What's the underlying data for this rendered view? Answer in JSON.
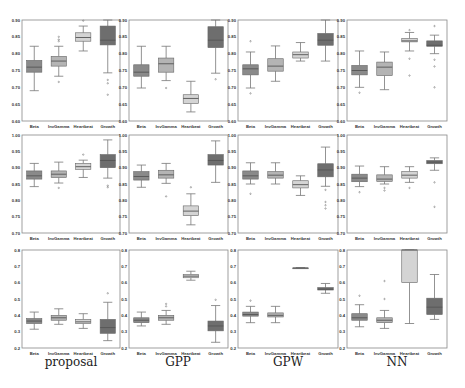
{
  "colors": {
    "Beta": "#8a8a8a",
    "InvGamma": "#b4b4b4",
    "Heartbeat": "#d4d4d4",
    "Growth": "#6e6e6e",
    "median": "#555555",
    "whisker": "#777777",
    "frame": "#888888"
  },
  "column_labels": [
    "proposal",
    "GPP",
    "GPW",
    "NN"
  ],
  "chart_data": [
    {
      "type": "box",
      "row": 0,
      "col": 0,
      "method": "proposal",
      "categories": [
        "Beta",
        "InvGamma",
        "Heartbeat",
        "Growth"
      ],
      "ylim": [
        0.6,
        0.9
      ],
      "yticks": [
        0.6,
        0.65,
        0.7,
        0.75,
        0.8,
        0.85,
        0.9
      ],
      "boxes": [
        {
          "wlo": 0.69,
          "q1": 0.745,
          "med": 0.76,
          "q3": 0.78,
          "whi": 0.822,
          "fliers": []
        },
        {
          "wlo": 0.733,
          "q1": 0.763,
          "med": 0.778,
          "q3": 0.792,
          "whi": 0.822,
          "fliers": [
            0.716,
            0.837,
            0.842,
            0.85
          ]
        },
        {
          "wlo": 0.808,
          "q1": 0.837,
          "med": 0.848,
          "q3": 0.862,
          "whi": 0.882,
          "fliers": [
            0.898
          ]
        },
        {
          "wlo": 0.743,
          "q1": 0.826,
          "med": 0.84,
          "q3": 0.882,
          "whi": 0.9,
          "fliers": [
            0.722,
            0.712,
            0.678
          ]
        }
      ]
    },
    {
      "type": "box",
      "row": 0,
      "col": 1,
      "method": "GPP",
      "categories": [
        "Beta",
        "InvGamma",
        "Heartbeat",
        "Growth"
      ],
      "ylim": [
        0.6,
        0.9
      ],
      "yticks": [
        0.6,
        0.65,
        0.7,
        0.75,
        0.8,
        0.85,
        0.9
      ],
      "boxes": [
        {
          "wlo": 0.698,
          "q1": 0.733,
          "med": 0.745,
          "q3": 0.767,
          "whi": 0.822,
          "fliers": []
        },
        {
          "wlo": 0.72,
          "q1": 0.745,
          "med": 0.77,
          "q3": 0.787,
          "whi": 0.822,
          "fliers": [
            0.698
          ]
        },
        {
          "wlo": 0.627,
          "q1": 0.652,
          "med": 0.667,
          "q3": 0.678,
          "whi": 0.718,
          "fliers": []
        },
        {
          "wlo": 0.742,
          "q1": 0.818,
          "med": 0.84,
          "q3": 0.88,
          "whi": 0.9,
          "fliers": [
            0.724
          ]
        }
      ]
    },
    {
      "type": "box",
      "row": 0,
      "col": 2,
      "method": "GPW",
      "categories": [
        "Beta",
        "InvGamma",
        "Heartbeat",
        "Growth"
      ],
      "ylim": [
        0.6,
        0.9
      ],
      "yticks": [
        0.6,
        0.65,
        0.7,
        0.75,
        0.8,
        0.85,
        0.9
      ],
      "boxes": [
        {
          "wlo": 0.698,
          "q1": 0.737,
          "med": 0.755,
          "q3": 0.767,
          "whi": 0.805,
          "fliers": [
            0.837,
            0.682
          ]
        },
        {
          "wlo": 0.718,
          "q1": 0.748,
          "med": 0.763,
          "q3": 0.785,
          "whi": 0.823,
          "fliers": []
        },
        {
          "wlo": 0.778,
          "q1": 0.787,
          "med": 0.797,
          "q3": 0.805,
          "whi": 0.833,
          "fliers": []
        },
        {
          "wlo": 0.778,
          "q1": 0.825,
          "med": 0.84,
          "q3": 0.86,
          "whi": 0.9,
          "fliers": []
        }
      ]
    },
    {
      "type": "box",
      "row": 0,
      "col": 3,
      "method": "NN",
      "categories": [
        "Beta",
        "InvGamma",
        "Heartbeat",
        "Growth"
      ],
      "ylim": [
        0.6,
        0.9
      ],
      "yticks": [
        0.6,
        0.65,
        0.7,
        0.75,
        0.8,
        0.85,
        0.9
      ],
      "boxes": [
        {
          "wlo": 0.7,
          "q1": 0.737,
          "med": 0.75,
          "q3": 0.765,
          "whi": 0.808,
          "fliers": [
            0.684
          ]
        },
        {
          "wlo": 0.693,
          "q1": 0.735,
          "med": 0.76,
          "q3": 0.775,
          "whi": 0.805,
          "fliers": []
        },
        {
          "wlo": 0.808,
          "q1": 0.835,
          "med": 0.838,
          "q3": 0.845,
          "whi": 0.863,
          "fliers": [
            0.87,
            0.785,
            0.735
          ]
        },
        {
          "wlo": 0.8,
          "q1": 0.822,
          "med": 0.825,
          "q3": 0.838,
          "whi": 0.855,
          "fliers": [
            0.882,
            0.782,
            0.762,
            0.7
          ]
        }
      ]
    },
    {
      "type": "box",
      "row": 1,
      "col": 0,
      "method": "proposal",
      "categories": [
        "Beta",
        "InvGamma",
        "Heartbeat",
        "Growth"
      ],
      "ylim": [
        0.7,
        1.0
      ],
      "yticks": [
        0.7,
        0.75,
        0.8,
        0.85,
        0.9,
        0.95,
        1.0
      ],
      "boxes": [
        {
          "wlo": 0.842,
          "q1": 0.865,
          "med": 0.875,
          "q3": 0.89,
          "whi": 0.913,
          "fliers": []
        },
        {
          "wlo": 0.853,
          "q1": 0.87,
          "med": 0.88,
          "q3": 0.89,
          "whi": 0.917,
          "fliers": [
            0.838
          ]
        },
        {
          "wlo": 0.87,
          "q1": 0.895,
          "med": 0.903,
          "q3": 0.913,
          "whi": 0.923,
          "fliers": [
            0.94
          ]
        },
        {
          "wlo": 0.868,
          "q1": 0.9,
          "med": 0.922,
          "q3": 0.94,
          "whi": 0.985,
          "fliers": [
            0.845,
            0.84
          ]
        }
      ]
    },
    {
      "type": "box",
      "row": 1,
      "col": 1,
      "method": "GPP",
      "categories": [
        "Beta",
        "InvGamma",
        "Heartbeat",
        "Growth"
      ],
      "ylim": [
        0.7,
        1.0
      ],
      "yticks": [
        0.7,
        0.75,
        0.8,
        0.85,
        0.9,
        0.95,
        1.0
      ],
      "boxes": [
        {
          "wlo": 0.84,
          "q1": 0.862,
          "med": 0.873,
          "q3": 0.888,
          "whi": 0.908,
          "fliers": []
        },
        {
          "wlo": 0.852,
          "q1": 0.868,
          "med": 0.878,
          "q3": 0.892,
          "whi": 0.913,
          "fliers": [
            0.812
          ]
        },
        {
          "wlo": 0.725,
          "q1": 0.753,
          "med": 0.767,
          "q3": 0.783,
          "whi": 0.82,
          "fliers": [
            0.84
          ]
        },
        {
          "wlo": 0.855,
          "q1": 0.908,
          "med": 0.922,
          "q3": 0.94,
          "whi": 0.982,
          "fliers": []
        }
      ]
    },
    {
      "type": "box",
      "row": 1,
      "col": 2,
      "method": "GPW",
      "categories": [
        "Beta",
        "InvGamma",
        "Heartbeat",
        "Growth"
      ],
      "ylim": [
        0.7,
        1.0
      ],
      "yticks": [
        0.7,
        0.75,
        0.8,
        0.85,
        0.9,
        0.95,
        1.0
      ],
      "boxes": [
        {
          "wlo": 0.85,
          "q1": 0.865,
          "med": 0.875,
          "q3": 0.89,
          "whi": 0.915,
          "fliers": [
            0.82
          ]
        },
        {
          "wlo": 0.85,
          "q1": 0.868,
          "med": 0.877,
          "q3": 0.888,
          "whi": 0.915,
          "fliers": []
        },
        {
          "wlo": 0.815,
          "q1": 0.838,
          "med": 0.848,
          "q3": 0.86,
          "whi": 0.875,
          "fliers": []
        },
        {
          "wlo": 0.843,
          "q1": 0.872,
          "med": 0.893,
          "q3": 0.912,
          "whi": 0.963,
          "fliers": [
            0.832,
            0.795,
            0.785,
            0.775
          ]
        }
      ]
    },
    {
      "type": "box",
      "row": 1,
      "col": 3,
      "method": "NN",
      "categories": [
        "Beta",
        "InvGamma",
        "Heartbeat",
        "Growth"
      ],
      "ylim": [
        0.7,
        1.0
      ],
      "yticks": [
        0.7,
        0.75,
        0.8,
        0.85,
        0.9,
        0.95,
        1.0
      ],
      "boxes": [
        {
          "wlo": 0.842,
          "q1": 0.857,
          "med": 0.868,
          "q3": 0.88,
          "whi": 0.905,
          "fliers": [
            0.825
          ]
        },
        {
          "wlo": 0.85,
          "q1": 0.858,
          "med": 0.865,
          "q3": 0.878,
          "whi": 0.903,
          "fliers": [
            0.83,
            0.838
          ]
        },
        {
          "wlo": 0.855,
          "q1": 0.868,
          "med": 0.877,
          "q3": 0.888,
          "whi": 0.903,
          "fliers": [
            0.838
          ]
        },
        {
          "wlo": 0.892,
          "q1": 0.912,
          "med": 0.917,
          "q3": 0.922,
          "whi": 0.93,
          "fliers": [
            0.855,
            0.78
          ]
        }
      ]
    },
    {
      "type": "box",
      "row": 2,
      "col": 0,
      "method": "proposal",
      "categories": [
        "Beta",
        "InvGamma",
        "Heartbeat",
        "Growth"
      ],
      "ylim": [
        0.2,
        0.8
      ],
      "yticks": [
        0.2,
        0.3,
        0.4,
        0.5,
        0.6,
        0.7,
        0.8
      ],
      "boxes": [
        {
          "wlo": 0.315,
          "q1": 0.35,
          "med": 0.365,
          "q3": 0.38,
          "whi": 0.42,
          "fliers": []
        },
        {
          "wlo": 0.345,
          "q1": 0.37,
          "med": 0.385,
          "q3": 0.4,
          "whi": 0.44,
          "fliers": []
        },
        {
          "wlo": 0.32,
          "q1": 0.35,
          "med": 0.36,
          "q3": 0.375,
          "whi": 0.41,
          "fliers": []
        },
        {
          "wlo": 0.245,
          "q1": 0.29,
          "med": 0.325,
          "q3": 0.375,
          "whi": 0.48,
          "fliers": [
            0.535
          ]
        }
      ]
    },
    {
      "type": "box",
      "row": 2,
      "col": 1,
      "method": "GPP",
      "categories": [
        "Beta",
        "InvGamma",
        "Heartbeat",
        "Growth"
      ],
      "ylim": [
        0.2,
        0.8
      ],
      "yticks": [
        0.2,
        0.3,
        0.4,
        0.5,
        0.6,
        0.7,
        0.8
      ],
      "boxes": [
        {
          "wlo": 0.335,
          "q1": 0.355,
          "med": 0.37,
          "q3": 0.385,
          "whi": 0.42,
          "fliers": []
        },
        {
          "wlo": 0.345,
          "q1": 0.37,
          "med": 0.385,
          "q3": 0.4,
          "whi": 0.43,
          "fliers": [
            0.455,
            0.47
          ]
        },
        {
          "wlo": 0.615,
          "q1": 0.63,
          "med": 0.64,
          "q3": 0.65,
          "whi": 0.67,
          "fliers": []
        },
        {
          "wlo": 0.235,
          "q1": 0.305,
          "med": 0.335,
          "q3": 0.365,
          "whi": 0.46,
          "fliers": [
            0.495
          ]
        }
      ]
    },
    {
      "type": "box",
      "row": 2,
      "col": 2,
      "method": "GPW",
      "categories": [
        "Beta",
        "InvGamma",
        "Heartbeat",
        "Growth"
      ],
      "ylim": [
        0.2,
        0.8
      ],
      "yticks": [
        0.2,
        0.3,
        0.4,
        0.5,
        0.6,
        0.7,
        0.8
      ],
      "boxes": [
        {
          "wlo": 0.355,
          "q1": 0.395,
          "med": 0.405,
          "q3": 0.42,
          "whi": 0.455,
          "fliers": [
            0.49
          ]
        },
        {
          "wlo": 0.355,
          "q1": 0.39,
          "med": 0.4,
          "q3": 0.415,
          "whi": 0.455,
          "fliers": []
        },
        {
          "wlo": 0.69,
          "q1": 0.69,
          "med": 0.69,
          "q3": 0.69,
          "whi": 0.69,
          "fliers": []
        },
        {
          "wlo": 0.535,
          "q1": 0.555,
          "med": 0.56,
          "q3": 0.57,
          "whi": 0.595,
          "fliers": []
        }
      ]
    },
    {
      "type": "box",
      "row": 2,
      "col": 3,
      "method": "NN",
      "categories": [
        "Beta",
        "InvGamma",
        "Heartbeat",
        "Growth"
      ],
      "ylim": [
        0.2,
        0.8
      ],
      "yticks": [
        0.2,
        0.3,
        0.4,
        0.5,
        0.6,
        0.7,
        0.8
      ],
      "boxes": [
        {
          "wlo": 0.33,
          "q1": 0.37,
          "med": 0.385,
          "q3": 0.41,
          "whi": 0.465,
          "fliers": [
            0.52
          ]
        },
        {
          "wlo": 0.32,
          "q1": 0.355,
          "med": 0.37,
          "q3": 0.385,
          "whi": 0.43,
          "fliers": [
            0.5,
            0.61
          ]
        },
        {
          "wlo": 0.35,
          "q1": 0.6,
          "med": 0.8,
          "q3": 0.8,
          "whi": 0.8,
          "fliers": []
        },
        {
          "wlo": 0.375,
          "q1": 0.405,
          "med": 0.45,
          "q3": 0.505,
          "whi": 0.65,
          "fliers": []
        }
      ]
    }
  ],
  "layout": {
    "rows": [
      [
        20,
        121
      ],
      [
        135,
        233
      ],
      [
        250,
        348
      ]
    ],
    "cols": [
      [
        22,
        120
      ],
      [
        129,
        228
      ],
      [
        238,
        338
      ],
      [
        347,
        447
      ]
    ],
    "label_centers": [
      71,
      178,
      288,
      397
    ]
  }
}
